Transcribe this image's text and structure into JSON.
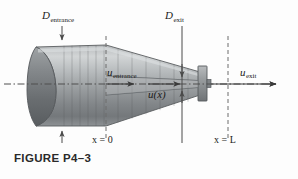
{
  "figure": {
    "caption": "FIGURE P4–3",
    "labels": {
      "d_entrance": {
        "symbol": "D",
        "subscript": "entrance",
        "name": "entrance-diameter-label"
      },
      "d_exit": {
        "symbol": "D",
        "subscript": "exit",
        "name": "exit-diameter-label"
      },
      "u_entrance": {
        "symbol": "u",
        "subscript": "entrance",
        "name": "entrance-velocity-label"
      },
      "u_exit": {
        "symbol": "u",
        "subscript": "exit",
        "name": "exit-velocity-label"
      },
      "u_x": {
        "symbol": "u",
        "argument": "(x)",
        "name": "local-velocity-label"
      },
      "x_zero": {
        "text": "x = 0",
        "name": "x-origin-label"
      },
      "x_length": {
        "text": "x = L",
        "name": "x-length-label"
      }
    },
    "colors": {
      "body_light": "#c9cccd",
      "body_mid": "#9da1a3",
      "body_dark": "#6e7275",
      "ink": "#1b1b1b",
      "leader": "#4a4a4a",
      "dash": "#6d6d6d",
      "caption": "#2a2a2a",
      "background": "#fdfdfd"
    }
  }
}
